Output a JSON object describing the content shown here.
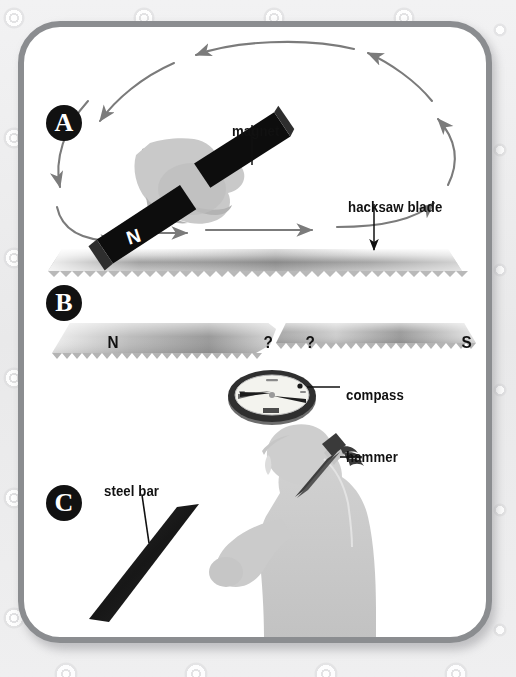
{
  "figure": {
    "background_color": "#ededee",
    "card_color": "#ffffff",
    "border_color": "#8b8d90"
  },
  "panels": [
    {
      "letter": "A",
      "name": "stroking-the-blade-with-a-magnet",
      "labels": [
        "magnet",
        "hacksaw blade"
      ],
      "magnet_poles": [
        "N",
        "S"
      ]
    },
    {
      "letter": "B",
      "name": "broken-blade-with-unknown-poles",
      "blade_labels": [
        "N",
        "?",
        "?",
        "S"
      ],
      "labels": [
        "compass"
      ]
    },
    {
      "letter": "C",
      "name": "hammering-a-steel-bar",
      "labels": [
        "hammer",
        "steel bar"
      ]
    }
  ],
  "badges": {
    "a": "A",
    "b": "B",
    "c": "C"
  },
  "callouts": {
    "magnet": "magnet",
    "hacksaw_blade": "hacksaw blade",
    "compass": "compass",
    "hammer": "hammer",
    "steel_bar": "steel bar"
  },
  "blade_b": {
    "left_pole": "N",
    "left_question": "?",
    "right_question": "?",
    "right_pole": "S"
  },
  "magnet_a": {
    "north_label": "N",
    "south_label": "S"
  },
  "colors": {
    "badge_fill": "#111111",
    "badge_text": "#ffffff",
    "text": "#111111",
    "magnet_body": "#0d0d0d",
    "hand_light": "#c9c9c9",
    "hand_mid": "#a8a8a8",
    "hand_dark": "#8e8e8e",
    "blade_light": "#f4f4f4",
    "blade_dark": "#8d8d8d",
    "arrow_stroke": "#7b7b7b",
    "leader_line": "#111111",
    "silhouette": "#c8c8c8",
    "silhouette_shade": "#bdbdbd",
    "compass_rim": "#3a3a3a",
    "compass_face": "#f2f2ee",
    "hammer": "#4a4a4a"
  }
}
